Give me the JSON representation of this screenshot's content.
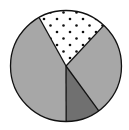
{
  "chart_data": {
    "type": "pie",
    "title": "",
    "legend": [],
    "start_angle_deg": 331,
    "direction": "clockwise",
    "slices": [
      {
        "label": "",
        "value": 20,
        "fill": "#ffffff",
        "pattern": "dots"
      },
      {
        "label": "",
        "value": 28,
        "fill": "#a7a7a7",
        "pattern": "none"
      },
      {
        "label": "",
        "value": 10,
        "fill": "#707070",
        "pattern": "none"
      },
      {
        "label": "",
        "value": 42,
        "fill": "#a7a7a7",
        "pattern": "none"
      }
    ],
    "values": [
      20,
      28,
      10,
      42
    ],
    "categories": [
      "",
      "",
      "",
      ""
    ]
  },
  "style": {
    "outline_color": "#111111",
    "dot_color": "#111111",
    "center_x": 66,
    "center_y": 66,
    "radius": 55.5
  }
}
